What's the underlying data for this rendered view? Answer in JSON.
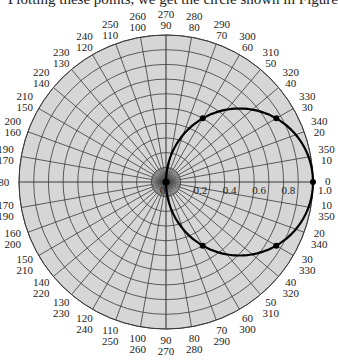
{
  "caption": "Plotting these points, we get the circle shown in Figure",
  "colors": {
    "disk_fill": "#d6d6d6",
    "grid": "#3a3a3a",
    "curve": "#000000",
    "text": "#222222"
  },
  "chart_data": {
    "type": "polar",
    "title": "",
    "equation": "r = cos θ",
    "center_px": [
      166,
      182
    ],
    "radius_px": 147,
    "r_max": 1.0,
    "grid": {
      "rings_step": 0.1,
      "spokes_step_deg": 10
    },
    "radial_tick_labels": [
      "0",
      "0.2",
      "0.4",
      "0.6",
      "0.8",
      "1.0"
    ],
    "angle_labels": [
      {
        "ccw": 0,
        "cw": 0,
        "text_outer": "0",
        "text_inner": ""
      },
      {
        "ccw": 10,
        "cw": 350,
        "text_outer": "350",
        "text_inner": "10"
      },
      {
        "ccw": 20,
        "cw": 340,
        "text_outer": "340",
        "text_inner": "20"
      },
      {
        "ccw": 30,
        "cw": 330,
        "text_outer": "330",
        "text_inner": "30"
      },
      {
        "ccw": 40,
        "cw": 320,
        "text_outer": "320",
        "text_inner": "40"
      },
      {
        "ccw": 50,
        "cw": 310,
        "text_outer": "310",
        "text_inner": "50"
      },
      {
        "ccw": 60,
        "cw": 300,
        "text_outer": "300",
        "text_inner": "60"
      },
      {
        "ccw": 70,
        "cw": 290,
        "text_outer": "290",
        "text_inner": "70"
      },
      {
        "ccw": 80,
        "cw": 280,
        "text_outer": "280",
        "text_inner": "80"
      },
      {
        "ccw": 90,
        "cw": 270,
        "text_outer": "270",
        "text_inner": "90"
      },
      {
        "ccw": 100,
        "cw": 260,
        "text_outer": "260",
        "text_inner": "100"
      },
      {
        "ccw": 110,
        "cw": 250,
        "text_outer": "250",
        "text_inner": "110"
      },
      {
        "ccw": 120,
        "cw": 240,
        "text_outer": "240",
        "text_inner": "120"
      },
      {
        "ccw": 130,
        "cw": 230,
        "text_outer": "230",
        "text_inner": "130"
      },
      {
        "ccw": 140,
        "cw": 220,
        "text_outer": "220",
        "text_inner": "140"
      },
      {
        "ccw": 150,
        "cw": 210,
        "text_outer": "210",
        "text_inner": "150"
      },
      {
        "ccw": 160,
        "cw": 200,
        "text_outer": "200",
        "text_inner": "160"
      },
      {
        "ccw": 170,
        "cw": 190,
        "text_outer": "190",
        "text_inner": "170"
      },
      {
        "ccw": 180,
        "cw": 180,
        "text_outer": "180",
        "text_inner": ""
      },
      {
        "ccw": 190,
        "cw": 170,
        "text_outer": "170",
        "text_inner": "190"
      },
      {
        "ccw": 200,
        "cw": 160,
        "text_outer": "160",
        "text_inner": "200"
      },
      {
        "ccw": 210,
        "cw": 150,
        "text_outer": "150",
        "text_inner": "210"
      },
      {
        "ccw": 220,
        "cw": 140,
        "text_outer": "140",
        "text_inner": "220"
      },
      {
        "ccw": 230,
        "cw": 130,
        "text_outer": "130",
        "text_inner": "230"
      },
      {
        "ccw": 240,
        "cw": 120,
        "text_outer": "120",
        "text_inner": "240"
      },
      {
        "ccw": 250,
        "cw": 110,
        "text_outer": "110",
        "text_inner": "250"
      },
      {
        "ccw": 260,
        "cw": 100,
        "text_outer": "100",
        "text_inner": "260"
      },
      {
        "ccw": 270,
        "cw": 90,
        "text_outer": "90",
        "text_inner": "270"
      },
      {
        "ccw": 280,
        "cw": 80,
        "text_outer": "80",
        "text_inner": "280"
      },
      {
        "ccw": 290,
        "cw": 70,
        "text_outer": "70",
        "text_inner": "290"
      },
      {
        "ccw": 300,
        "cw": 60,
        "text_outer": "60",
        "text_inner": "300"
      },
      {
        "ccw": 310,
        "cw": 50,
        "text_outer": "50",
        "text_inner": "310"
      },
      {
        "ccw": 320,
        "cw": 40,
        "text_outer": "40",
        "text_inner": "320"
      },
      {
        "ccw": 330,
        "cw": 30,
        "text_outer": "30",
        "text_inner": "330"
      },
      {
        "ccw": 340,
        "cw": 20,
        "text_outer": "20",
        "text_inner": "340"
      },
      {
        "ccw": 350,
        "cw": 10,
        "text_outer": "10",
        "text_inner": "350"
      }
    ],
    "series": [
      {
        "name": "r = cos θ",
        "type": "curve",
        "theta_range_deg": [
          -90,
          90
        ]
      }
    ],
    "points": [
      {
        "theta_deg": 0,
        "r": 1.0
      },
      {
        "theta_deg": 30,
        "r": 0.866
      },
      {
        "theta_deg": 60,
        "r": 0.5
      },
      {
        "theta_deg": 90,
        "r": 0.0
      },
      {
        "theta_deg": -30,
        "r": 0.866
      },
      {
        "theta_deg": -60,
        "r": 0.5
      }
    ]
  }
}
